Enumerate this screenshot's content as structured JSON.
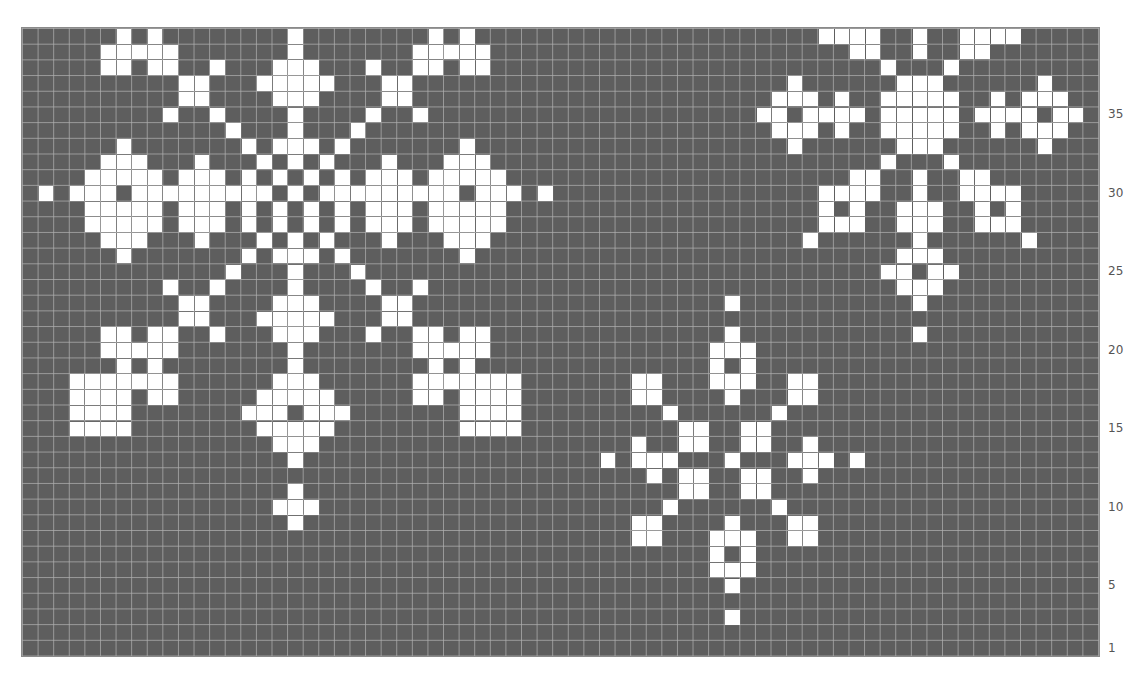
{
  "figure": {
    "grid": {
      "columns": 69,
      "rows": 40
    },
    "colors": {
      "background": "#5e5e5e",
      "stitch": "#ffffff",
      "gridline": "#afafaf",
      "label": "#555555"
    }
  },
  "row_labels": [
    {
      "label": "35",
      "row": 35
    },
    {
      "label": "30",
      "row": 30
    },
    {
      "label": "25",
      "row": 25
    },
    {
      "label": "20",
      "row": 20
    },
    {
      "label": "15",
      "row": 15
    },
    {
      "label": "10",
      "row": 10
    },
    {
      "label": "5",
      "row": 5
    },
    {
      "label": "1",
      "row": 1
    }
  ],
  "chart_data": {
    "type": "heatmap",
    "title": "",
    "xlabel": "",
    "ylabel": "Row",
    "yticks": [
      1,
      5,
      10,
      15,
      20,
      25,
      30,
      35
    ],
    "grid": true,
    "columns": 69,
    "rows": 40,
    "note": "white cells listed per row index from top (0) as column indices",
    "white_cells": {
      "0": [
        6,
        8,
        17,
        26,
        28,
        51,
        52,
        53,
        54,
        57,
        60,
        61,
        62,
        63
      ],
      "1": [
        5,
        6,
        7,
        8,
        9,
        17,
        25,
        26,
        27,
        28,
        29,
        53,
        54,
        57,
        60,
        61
      ],
      "2": [
        5,
        6,
        8,
        9,
        12,
        16,
        17,
        18,
        22,
        25,
        26,
        28,
        29,
        55,
        59
      ],
      "3": [
        10,
        11,
        15,
        16,
        17,
        18,
        19,
        23,
        24,
        49,
        56,
        57,
        58,
        65
      ],
      "4": [
        10,
        11,
        16,
        17,
        18,
        23,
        24,
        48,
        49,
        50,
        52,
        55,
        56,
        57,
        58,
        59,
        62,
        64,
        65,
        66
      ],
      "5": [
        9,
        12,
        17,
        22,
        25,
        47,
        48,
        50,
        51,
        52,
        53,
        55,
        56,
        57,
        58,
        59,
        61,
        62,
        63,
        64,
        66,
        67
      ],
      "6": [
        13,
        17,
        21,
        48,
        49,
        50,
        52,
        55,
        56,
        57,
        58,
        59,
        62,
        64,
        65,
        66
      ],
      "7": [
        6,
        14,
        16,
        17,
        18,
        20,
        28,
        49,
        56,
        57,
        58,
        65
      ],
      "8": [
        5,
        6,
        7,
        11,
        15,
        17,
        19,
        23,
        27,
        28,
        29,
        55,
        59
      ],
      "9": [
        4,
        5,
        6,
        7,
        8,
        10,
        11,
        12,
        14,
        16,
        18,
        20,
        22,
        23,
        24,
        26,
        27,
        28,
        29,
        30,
        53,
        54,
        57,
        60,
        61
      ],
      "10": [
        1,
        3,
        4,
        5,
        7,
        8,
        9,
        10,
        11,
        12,
        13,
        14,
        15,
        17,
        19,
        20,
        21,
        22,
        23,
        24,
        25,
        26,
        27,
        29,
        30,
        31,
        33,
        51,
        52,
        53,
        54,
        57,
        60,
        61,
        62,
        63
      ],
      "11": [
        4,
        5,
        6,
        7,
        8,
        10,
        11,
        12,
        14,
        16,
        18,
        20,
        22,
        23,
        24,
        26,
        27,
        28,
        29,
        30,
        51,
        53,
        56,
        57,
        58,
        61,
        63
      ],
      "12": [
        4,
        5,
        6,
        7,
        8,
        10,
        11,
        12,
        14,
        16,
        18,
        20,
        22,
        23,
        24,
        26,
        27,
        28,
        29,
        30,
        51,
        52,
        53,
        56,
        57,
        58,
        61,
        62,
        63
      ],
      "13": [
        5,
        6,
        7,
        11,
        15,
        17,
        19,
        23,
        27,
        28,
        29,
        50,
        57,
        64
      ],
      "14": [
        6,
        14,
        16,
        17,
        18,
        20,
        28,
        56,
        57,
        58
      ],
      "15": [
        13,
        17,
        21,
        55,
        56,
        58,
        59
      ],
      "16": [
        9,
        12,
        17,
        22,
        25,
        56,
        57,
        58
      ],
      "17": [
        10,
        11,
        16,
        17,
        18,
        23,
        24,
        45,
        57
      ],
      "18": [
        10,
        11,
        15,
        16,
        17,
        18,
        19,
        23,
        24
      ],
      "19": [
        5,
        6,
        8,
        9,
        12,
        16,
        17,
        18,
        22,
        25,
        26,
        28,
        29,
        45,
        57
      ],
      "20": [
        5,
        6,
        7,
        8,
        9,
        17,
        25,
        26,
        27,
        28,
        29,
        44,
        45,
        46
      ],
      "21": [
        6,
        8,
        17,
        26,
        28,
        44,
        46
      ],
      "22": [
        3,
        4,
        5,
        6,
        7,
        8,
        9,
        16,
        17,
        18,
        25,
        26,
        27,
        28,
        29,
        30,
        31,
        39,
        40,
        44,
        45,
        46,
        49,
        50
      ],
      "23": [
        3,
        4,
        5,
        6,
        8,
        9,
        15,
        16,
        17,
        18,
        19,
        25,
        26,
        28,
        29,
        30,
        31,
        39,
        40,
        45,
        49,
        50
      ],
      "24": [
        3,
        4,
        5,
        6,
        14,
        15,
        16,
        18,
        19,
        20,
        28,
        29,
        30,
        31,
        41,
        48
      ],
      "25": [
        3,
        4,
        5,
        6,
        15,
        16,
        17,
        18,
        19,
        28,
        29,
        30,
        31,
        42,
        43,
        46,
        47
      ],
      "26": [
        16,
        17,
        18,
        39,
        42,
        43,
        46,
        47,
        50
      ],
      "27": [
        17,
        37,
        39,
        40,
        41,
        45,
        49,
        50,
        51,
        53
      ],
      "28": [
        40,
        42,
        43,
        46,
        47,
        50
      ],
      "29": [
        17,
        42,
        43,
        46,
        47
      ],
      "30": [
        16,
        17,
        18,
        41,
        48
      ],
      "31": [
        17,
        39,
        40,
        45,
        49,
        50
      ],
      "32": [
        39,
        40,
        44,
        45,
        46,
        49,
        50
      ],
      "33": [
        44,
        46
      ],
      "34": [
        44,
        45,
        46
      ],
      "35": [
        45
      ],
      "37": [
        45
      ]
    }
  }
}
